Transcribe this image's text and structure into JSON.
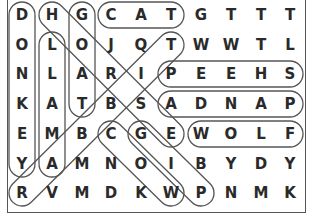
{
  "puzzle": {
    "type": "word-search",
    "rows": 7,
    "cols": 10,
    "grid": [
      [
        "D",
        "H",
        "G",
        "C",
        "A",
        "T",
        "G",
        "T",
        "T",
        "T"
      ],
      [
        "O",
        "L",
        "O",
        "J",
        "Q",
        "T",
        "W",
        "W",
        "T",
        "L"
      ],
      [
        "N",
        "L",
        "A",
        "R",
        "I",
        "P",
        "E",
        "E",
        "H",
        "S"
      ],
      [
        "K",
        "A",
        "T",
        "B",
        "S",
        "A",
        "D",
        "N",
        "A",
        "P"
      ],
      [
        "E",
        "M",
        "B",
        "C",
        "G",
        "E",
        "W",
        "O",
        "L",
        "F"
      ],
      [
        "Y",
        "A",
        "M",
        "N",
        "O",
        "I",
        "B",
        "Y",
        "D",
        "Y"
      ],
      [
        "R",
        "V",
        "M",
        "D",
        "K",
        "W",
        "P",
        "N",
        "M",
        "K"
      ]
    ],
    "found_words": [
      {
        "word": "DONKEY",
        "start": [
          0,
          0
        ],
        "end": [
          5,
          0
        ]
      },
      {
        "word": "LLAMA",
        "start": [
          1,
          1
        ],
        "end": [
          5,
          1
        ]
      },
      {
        "word": "GOAT",
        "start": [
          0,
          2
        ],
        "end": [
          3,
          2
        ]
      },
      {
        "word": "CAT",
        "start": [
          0,
          3
        ],
        "end": [
          0,
          5
        ]
      },
      {
        "word": "SHEEP",
        "start": [
          2,
          9
        ],
        "end": [
          2,
          5
        ]
      },
      {
        "word": "PANDA",
        "start": [
          3,
          9
        ],
        "end": [
          3,
          5
        ]
      },
      {
        "word": "WOLF",
        "start": [
          4,
          6
        ],
        "end": [
          4,
          9
        ]
      },
      {
        "word": "HORSE",
        "start": [
          0,
          1
        ],
        "end": [
          4,
          5
        ]
      },
      {
        "word": "RABBIT",
        "start": [
          6,
          0
        ],
        "end": [
          1,
          5
        ]
      },
      {
        "word": "COW",
        "start": [
          4,
          3
        ],
        "end": [
          6,
          5
        ]
      },
      {
        "word": "PIG",
        "start": [
          6,
          6
        ],
        "end": [
          4,
          4
        ]
      }
    ]
  },
  "layout": {
    "col_x": [
      22,
      52,
      82,
      111,
      141,
      171,
      201,
      231,
      261,
      290
    ],
    "row_y": [
      15,
      45,
      74,
      104,
      134,
      164,
      193
    ],
    "capsule_radius": 13
  },
  "colors": {
    "letter": "#2a2a2a",
    "capsule_stroke": "#555555",
    "frame": "#555555",
    "background": "#ffffff"
  }
}
